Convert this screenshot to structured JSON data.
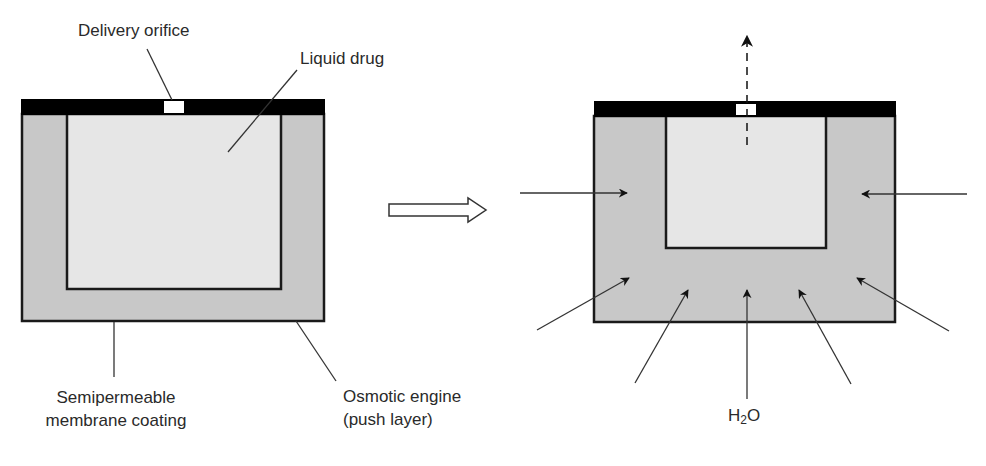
{
  "diagram": {
    "colors": {
      "membrane_fill": "#c8c8c8",
      "drug_fill": "#e6e6e6",
      "cap": "#000000",
      "outline": "#1a1a1a",
      "leader": "#333333",
      "background": "#ffffff"
    },
    "left_device": {
      "state": "before",
      "labels": {
        "delivery_orifice": "Delivery orifice",
        "liquid_drug": "Liquid drug",
        "membrane_line1": "Semipermeable",
        "membrane_line2": "membrane coating",
        "engine_line1": "Osmotic engine",
        "engine_line2": "(push layer)"
      }
    },
    "transition_arrow": "hollow-right-arrow",
    "right_device": {
      "state": "after",
      "drug_release_arrow": "dashed-up-arrow",
      "water_arrows_count": 7,
      "water_label_main": "H",
      "water_label_sub": "2",
      "water_label_tail": "O"
    }
  }
}
